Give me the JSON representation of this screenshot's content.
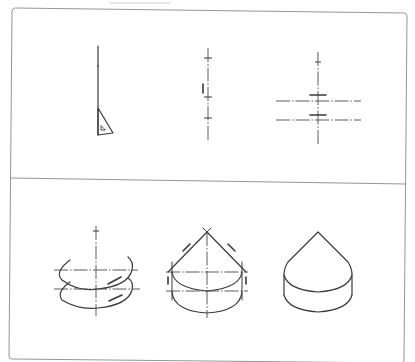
{
  "figure": {
    "panels": [
      {
        "id": "top",
        "steps": [
          {
            "index": 1,
            "name": "vertical axis with set-square",
            "icon": "set-square-icon"
          },
          {
            "index": 2,
            "name": "mark heights on axis",
            "icon": "tick-marks-icon"
          },
          {
            "index": 3,
            "name": "draw horizontal center lines",
            "icon": "center-lines-icon"
          }
        ]
      },
      {
        "id": "bottom",
        "steps": [
          {
            "index": 4,
            "name": "draw ellipses for cylinder",
            "icon": "ellipse-icon"
          },
          {
            "index": 5,
            "name": "draw cone tangents and vertical edges",
            "icon": "cone-construction-icon"
          },
          {
            "index": 6,
            "name": "finished cone on cylinder",
            "icon": "cone-cylinder-icon"
          }
        ]
      }
    ],
    "colors": {
      "ink": "#3a3a3a",
      "frame": "#8a8a8a",
      "background": "#ffffff"
    }
  }
}
